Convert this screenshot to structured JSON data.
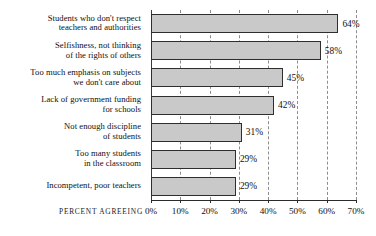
{
  "chart_data": {
    "type": "bar",
    "orientation": "horizontal",
    "title": "",
    "xlabel": "PERCENT AGREEING",
    "ylabel": "",
    "xlim": [
      0,
      70
    ],
    "grid": true,
    "legend": null,
    "xticks": [
      "0%",
      "10%",
      "20%",
      "30%",
      "40%",
      "50%",
      "60%",
      "70%"
    ],
    "xtick_values": [
      0,
      10,
      20,
      30,
      40,
      50,
      60,
      70
    ],
    "categories": [
      "Students who don't respect\nteachers and authorities",
      "Selfishness, not thinking\nof the rights of others",
      "Too much emphasis on subjects\nwe don't care about",
      "Lack of government funding\nfor schools",
      "Not enough discipline\nof students",
      "Too many students\nin the classroom",
      "Incompetent, poor teachers"
    ],
    "values": [
      64,
      58,
      45,
      42,
      31,
      29,
      29
    ],
    "value_labels": [
      "64%",
      "58%",
      "45%",
      "42%",
      "31%",
      "29%",
      "29%"
    ],
    "colors": {
      "bar_fill": "#c9c9c9",
      "bar_border": "#2e2e2e",
      "gridline": "#8c8c8c",
      "axis": "#2b2b2b",
      "text": "#101010",
      "background": "#ffffff"
    }
  }
}
